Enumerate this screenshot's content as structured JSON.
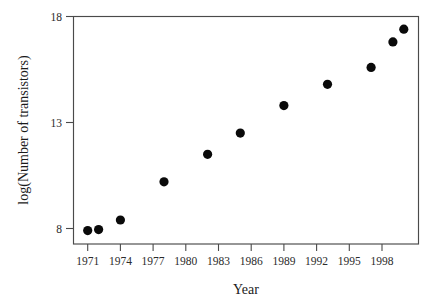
{
  "chart_data": {
    "type": "scatter",
    "title": "",
    "xlabel": "Year",
    "ylabel": "log(Number of transistors)",
    "xlim": [
      1969.8,
      2000.3
    ],
    "ylim": [
      7.2,
      18.2
    ],
    "grid": false,
    "legend": "none",
    "x_ticks": [
      1971,
      1974,
      1977,
      1980,
      1983,
      1986,
      1989,
      1992,
      1995,
      1998
    ],
    "x_tick_labels": [
      "1971",
      "1974",
      "1977",
      "1980",
      "1983",
      "1986",
      "1989",
      "1992",
      "1995",
      "1998"
    ],
    "y_ticks": [
      8,
      13,
      18
    ],
    "y_tick_labels": [
      "8",
      "13",
      "18"
    ],
    "marker": "filled-circle",
    "marker_color": "#0a0a0a",
    "marker_size": 5,
    "x": [
      1971,
      1972,
      1974,
      1978,
      1982,
      1985,
      1989,
      1993,
      1997,
      1999,
      2000
    ],
    "y": [
      7.9,
      7.95,
      8.4,
      10.2,
      11.5,
      12.5,
      13.8,
      14.8,
      15.6,
      16.8,
      17.4
    ],
    "points": [
      {
        "x": 1971,
        "y": 7.9
      },
      {
        "x": 1972,
        "y": 7.95
      },
      {
        "x": 1974,
        "y": 8.4
      },
      {
        "x": 1978,
        "y": 10.2
      },
      {
        "x": 1982,
        "y": 11.5
      },
      {
        "x": 1985,
        "y": 12.5
      },
      {
        "x": 1989,
        "y": 13.8
      },
      {
        "x": 1993,
        "y": 14.8
      },
      {
        "x": 1997,
        "y": 15.6
      },
      {
        "x": 1999,
        "y": 16.8
      },
      {
        "x": 2000,
        "y": 17.4
      }
    ]
  },
  "figure": {
    "background_color": "#ffffff",
    "frame_color": "#4a4a4a",
    "text_color": "#2b2b2b"
  }
}
